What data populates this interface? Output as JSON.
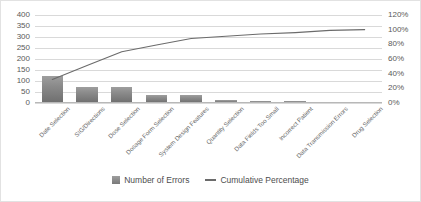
{
  "chart_data": {
    "type": "bar",
    "title": "",
    "subtitle": "",
    "xlabel": "",
    "ylabel": "",
    "categories": [
      "Date Selection",
      "SIG/Directions",
      "Dose Selection",
      "Dosage Form Selection",
      "System Design Features",
      "Quantity Selection",
      "Data Fields Too Small",
      "Incorrect Patient",
      "Data Transmission Errors",
      "Drug Selection"
    ],
    "series": [
      {
        "name": "Number of Errors",
        "type": "bar",
        "axis": "left",
        "values": [
          125,
          75,
          75,
          38,
          35,
          12,
          10,
          10,
          3,
          2
        ]
      },
      {
        "name": "Cumulative Percentage",
        "type": "line",
        "axis": "right",
        "values": [
          32,
          51,
          70,
          79,
          88,
          91,
          94,
          96,
          99,
          100
        ]
      }
    ],
    "y_left": {
      "min": 0,
      "max": 400,
      "step": 50,
      "ticks": [
        "0",
        "50",
        "100",
        "150",
        "200",
        "250",
        "300",
        "350",
        "400"
      ]
    },
    "y_right": {
      "min": 0,
      "max": 120,
      "step": 20,
      "ticks": [
        "0%",
        "20%",
        "40%",
        "60%",
        "80%",
        "100%",
        "120%"
      ]
    },
    "grid": true,
    "legend": {
      "position": "bottom",
      "entries": [
        {
          "label": "Number of Errors",
          "marker": "bar-swatch-icon",
          "color": "#8a8a8a"
        },
        {
          "label": "Cumulative Percentage",
          "marker": "line-swatch-icon",
          "color": "#6b6b6b"
        }
      ]
    },
    "colors": {
      "bar_top": "#9e9e9e",
      "bar_bottom": "#6e6e6e",
      "line": "#6b6b6b",
      "gridline": "#d9d9d9",
      "axis": "#b8b8b8",
      "text": "#5a5a5a",
      "background": "#ffffff",
      "border": "#e2e2e2"
    }
  }
}
